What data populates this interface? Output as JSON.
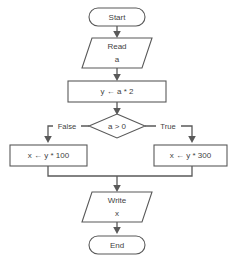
{
  "diagram": {
    "type": "flowchart",
    "colors": {
      "stroke": "#595959",
      "text": "#3f3f3f",
      "fill": "#ffffff",
      "background": "#ffffff"
    },
    "nodes": {
      "start": {
        "shape": "terminator",
        "label": "Start"
      },
      "read": {
        "shape": "parallelogram",
        "label_line1": "Read",
        "label_line2": "a"
      },
      "assign_y": {
        "shape": "process",
        "label": "y ← a * 2"
      },
      "decision": {
        "shape": "diamond",
        "label": "a > 0"
      },
      "assign_x_false": {
        "shape": "process",
        "label": "x ← y * 100"
      },
      "assign_x_true": {
        "shape": "process",
        "label": "x ← y * 300"
      },
      "write": {
        "shape": "parallelogram",
        "label_line1": "Write",
        "label_line2": "x"
      },
      "end": {
        "shape": "terminator",
        "label": "End"
      }
    },
    "edges": {
      "false_label": "False",
      "true_label": "True"
    }
  }
}
